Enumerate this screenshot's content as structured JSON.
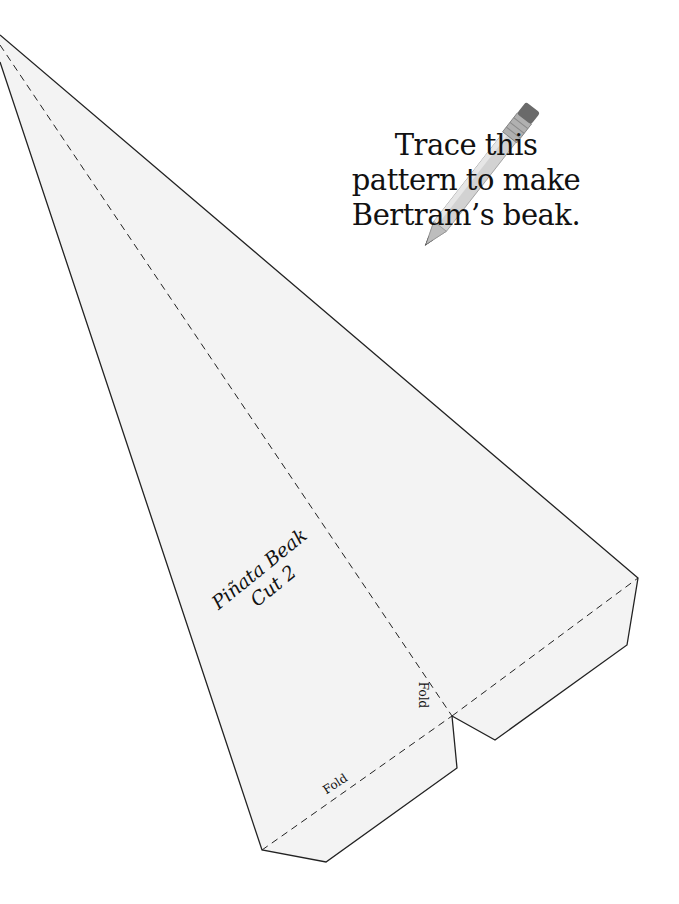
{
  "document": {
    "type": "craft pattern template",
    "instruction": {
      "lines": [
        "Trace this",
        "pattern to make",
        "Bertram’s beak."
      ]
    },
    "piece_label": {
      "title": "Piñata Beak",
      "quantity": "Cut 2"
    },
    "fold_labels": {
      "bottom": "Fold",
      "right": "Fold"
    },
    "decoration": {
      "icon": "pencil-icon"
    },
    "colors": {
      "paper": "#f3f3f3",
      "background": "#ffffff",
      "outline": "#222222",
      "pencil_body": "#cfcfcf",
      "pencil_ferrule": "#a9a9a9",
      "pencil_eraser": "#6a6a6a"
    }
  }
}
